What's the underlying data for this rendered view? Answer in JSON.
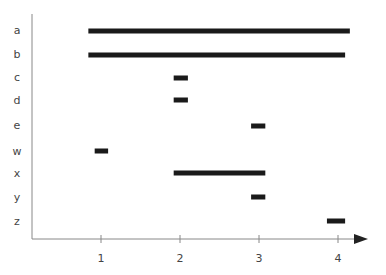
{
  "chart_data": {
    "type": "bar",
    "subtype": "horizontal-range (gantt-like)",
    "title": "",
    "xlabel": "",
    "ylabel": "",
    "categories": [
      "a",
      "b",
      "c",
      "d",
      "e",
      "w",
      "x",
      "y",
      "z"
    ],
    "series": [
      {
        "name": "interval",
        "ranges": [
          [
            0.84,
            4.15
          ],
          [
            0.84,
            4.09
          ],
          [
            1.92,
            2.1
          ],
          [
            1.92,
            2.1
          ],
          [
            2.9,
            3.08
          ],
          [
            0.92,
            1.09
          ],
          [
            1.92,
            3.08
          ],
          [
            2.9,
            3.08
          ],
          [
            3.86,
            4.09
          ]
        ]
      }
    ],
    "xticks": [
      "1",
      "2",
      "3",
      "4"
    ],
    "xtick_values": [
      1,
      2,
      3,
      4
    ],
    "xlim": [
      0.13,
      4.38
    ],
    "grid": false,
    "legend": "none",
    "x_axis_arrow": true,
    "bar_color": "#1a1a1a",
    "axis_color": "#888888"
  }
}
